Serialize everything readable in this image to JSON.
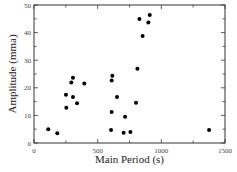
{
  "chart_data": {
    "type": "scatter",
    "title": "",
    "xlabel": "Main Period (s)",
    "ylabel": "Amplitude (mma)",
    "xlim": [
      0,
      1500
    ],
    "ylim": [
      0,
      50
    ],
    "xticks": [
      0,
      500,
      1000,
      1500
    ],
    "xtick_labels": [
      "0",
      "500",
      "1000",
      "1500"
    ],
    "xminor_step": 250,
    "yticks": [
      0,
      10,
      20,
      30,
      40,
      50
    ],
    "ytick_labels": [
      "0",
      "10",
      "20",
      "30",
      "40",
      "50"
    ],
    "yminor_step": 5,
    "grid": false,
    "legend": null,
    "marker_color": "#000000",
    "series": [
      {
        "name": "points",
        "x": [
          112,
          183,
          254,
          251,
          306,
          293,
          306,
          338,
          395,
          615,
          610,
          652,
          610,
          605,
          715,
          704,
          757,
          801,
          812,
          853,
          828,
          909,
          898,
          1375
        ],
        "y": [
          5.0,
          3.5,
          12.8,
          17.5,
          23.6,
          21.9,
          16.7,
          14.4,
          21.6,
          24.4,
          22.6,
          16.7,
          11.2,
          4.7,
          9.5,
          3.7,
          4.0,
          14.6,
          26.9,
          38.8,
          44.9,
          46.4,
          43.7,
          4.7
        ]
      }
    ]
  },
  "layout": {
    "plot_left": 34,
    "plot_right": 225,
    "plot_top": 5,
    "plot_bottom": 143
  }
}
